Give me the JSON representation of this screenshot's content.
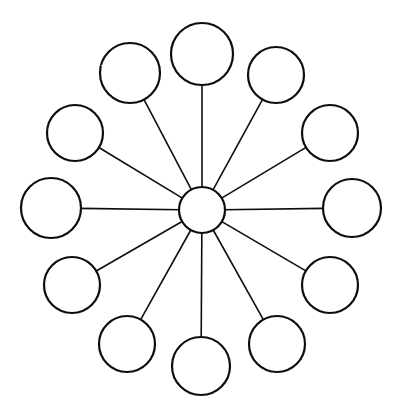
{
  "diagram": {
    "type": "radial-network",
    "background_color": "#ffffff",
    "stroke_color": "#0d0d0d",
    "spoke_color": "#111111",
    "node_fill": "#ffffff",
    "node_count": 13,
    "satellite_count": 12,
    "spoke_count": 12,
    "style": "hand-drawn line art, no labels",
    "canvas": {
      "width": 401,
      "height": 414
    },
    "hub": {
      "name": "center-hub",
      "cx": 202,
      "cy": 210,
      "r": 23,
      "stroke_width": 2.2,
      "label": ""
    },
    "satellites": [
      {
        "name": "node-top",
        "angle_deg": 270,
        "cx": 202,
        "cy": 54,
        "r": 31,
        "label": ""
      },
      {
        "name": "node-upper-right-1",
        "angle_deg": 300,
        "cx": 276,
        "cy": 75,
        "r": 28,
        "label": ""
      },
      {
        "name": "node-upper-right-2",
        "angle_deg": 330,
        "cx": 330,
        "cy": 133,
        "r": 28,
        "label": ""
      },
      {
        "name": "node-right",
        "angle_deg": 0,
        "cx": 352,
        "cy": 208,
        "r": 29,
        "label": ""
      },
      {
        "name": "node-lower-right-1",
        "angle_deg": 30,
        "cx": 330,
        "cy": 285,
        "r": 28,
        "label": ""
      },
      {
        "name": "node-lower-right-2",
        "angle_deg": 60,
        "cx": 277,
        "cy": 344,
        "r": 28,
        "label": ""
      },
      {
        "name": "node-bottom",
        "angle_deg": 90,
        "cx": 201,
        "cy": 366,
        "r": 29,
        "label": ""
      },
      {
        "name": "node-lower-left-2",
        "angle_deg": 120,
        "cx": 127,
        "cy": 344,
        "r": 28,
        "label": ""
      },
      {
        "name": "node-lower-left-1",
        "angle_deg": 150,
        "cx": 72,
        "cy": 285,
        "r": 28,
        "label": ""
      },
      {
        "name": "node-left",
        "angle_deg": 180,
        "cx": 51,
        "cy": 208,
        "r": 30,
        "label": ""
      },
      {
        "name": "node-upper-left-2",
        "angle_deg": 210,
        "cx": 75,
        "cy": 133,
        "r": 28,
        "label": ""
      },
      {
        "name": "node-upper-left-1",
        "angle_deg": 240,
        "cx": 130,
        "cy": 73,
        "r": 30,
        "label": ""
      }
    ],
    "spokes": [
      {
        "name": "spoke-to-node-top",
        "from": "center-hub",
        "to": "node-top"
      },
      {
        "name": "spoke-to-node-upper-right-1",
        "from": "center-hub",
        "to": "node-upper-right-1"
      },
      {
        "name": "spoke-to-node-upper-right-2",
        "from": "center-hub",
        "to": "node-upper-right-2"
      },
      {
        "name": "spoke-to-node-right",
        "from": "center-hub",
        "to": "node-right"
      },
      {
        "name": "spoke-to-node-lower-right-1",
        "from": "center-hub",
        "to": "node-lower-right-1"
      },
      {
        "name": "spoke-to-node-lower-right-2",
        "from": "center-hub",
        "to": "node-lower-right-2"
      },
      {
        "name": "spoke-to-node-bottom",
        "from": "center-hub",
        "to": "node-bottom"
      },
      {
        "name": "spoke-to-node-lower-left-2",
        "from": "center-hub",
        "to": "node-lower-left-2"
      },
      {
        "name": "spoke-to-node-lower-left-1",
        "from": "center-hub",
        "to": "node-lower-left-1"
      },
      {
        "name": "spoke-to-node-left",
        "from": "center-hub",
        "to": "node-left"
      },
      {
        "name": "spoke-to-node-upper-left-2",
        "from": "center-hub",
        "to": "node-upper-left-2"
      },
      {
        "name": "spoke-to-node-upper-left-1",
        "from": "center-hub",
        "to": "node-upper-left-1"
      }
    ]
  }
}
